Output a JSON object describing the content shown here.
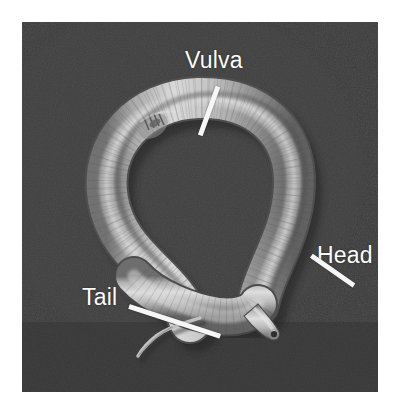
{
  "figure": {
    "kind": "sem-micrograph",
    "background_color": "#ffffff",
    "plate_color": "#3b3b3b",
    "label_color": "#fdfdfd",
    "pointer_color": "#f6f6f6",
    "body_color": "#c9c9c9"
  },
  "annotations": [
    {
      "id": "vulva",
      "label": "Vulva",
      "icon": "pointer-line-icon",
      "points_to": "mid-body ventral opening on upper loop"
    },
    {
      "id": "head",
      "label": "Head",
      "icon": "pointer-line-icon",
      "points_to": "tapered anterior tip with mouth"
    },
    {
      "id": "tail",
      "label": "Tail",
      "icon": "pointer-line-icon",
      "points_to": "thin whip-like posterior filament"
    }
  ],
  "specimen": {
    "name": "nematode",
    "posture": "looped body forming a teardrop with crossing anterior",
    "surface": "annulated cuticle"
  }
}
